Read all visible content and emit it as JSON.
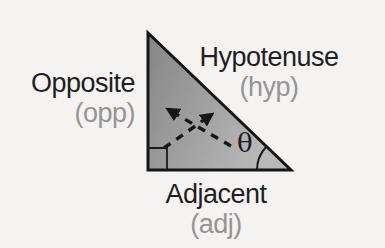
{
  "diagram": {
    "type": "right-triangle-trigonometry",
    "sides": {
      "hypotenuse": {
        "label": "Hypotenuse",
        "abbr": "(hyp)"
      },
      "opposite": {
        "label": "Opposite",
        "abbr": "(opp)"
      },
      "adjacent": {
        "label": "Adjacent",
        "abbr": "(adj)"
      }
    },
    "angle": {
      "symbol": "θ"
    },
    "markers": {
      "right_angle_marker": "square-corner-marker",
      "angle_arc": "theta-angle-arc",
      "arrow_1": "dashed-arrow-to-opposite-side",
      "arrow_2": "dashed-arrow-to-hypotenuse"
    },
    "colors": {
      "background": "#f5f3f1",
      "label_primary": "#1f1f1f",
      "label_secondary": "#949494",
      "triangle_fill_start": "#858585",
      "triangle_fill_end": "#b9b9b9",
      "line": "#161616"
    }
  }
}
